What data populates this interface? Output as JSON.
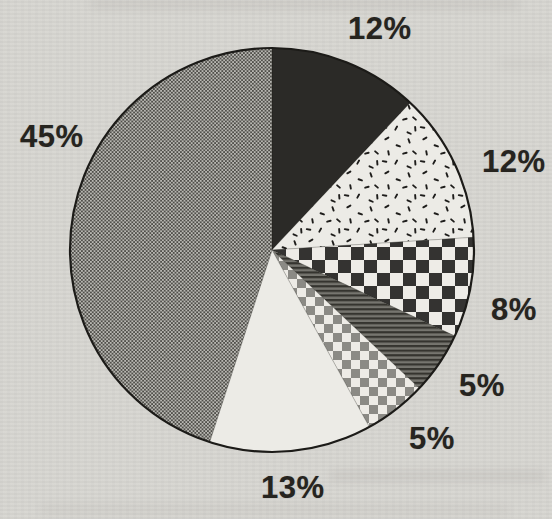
{
  "page": {
    "paper_color": "#d7d6d1",
    "ink_color": "#26241f"
  },
  "chart_data": {
    "type": "pie",
    "title": "",
    "unit": "percent",
    "direction": "clockwise",
    "start": "12-o-clock",
    "legend": "none",
    "segments": [
      {
        "label": "12%",
        "value": 12,
        "pattern": "solid-black"
      },
      {
        "label": "12%",
        "value": 12,
        "pattern": "speckle-dashes"
      },
      {
        "label": "8%",
        "value": 8,
        "pattern": "large-checkerboard"
      },
      {
        "label": "5%",
        "value": 5,
        "pattern": "dark-horizontal-lines"
      },
      {
        "label": "5%",
        "value": 5,
        "pattern": "small-checkerboard"
      },
      {
        "label": "13%",
        "value": 13,
        "pattern": "plain-white"
      },
      {
        "label": "45%",
        "value": 45,
        "pattern": "gray-halftone"
      }
    ],
    "colors": {
      "slice_black": "#2b2a27",
      "slice_white": "#ecebe6",
      "checker_dark": "#343331",
      "checker_gray": "#8b8a85",
      "halftone_dot": "#504f4a",
      "outline": "#1c1b18"
    }
  }
}
